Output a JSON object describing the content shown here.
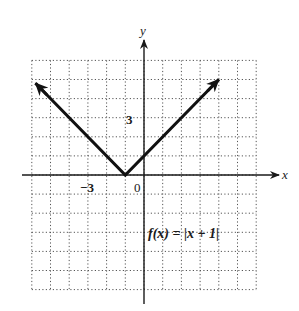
{
  "chart_data": {
    "type": "line",
    "title": "",
    "function_label": "f(x) = |x + 1|",
    "xlabel": "x",
    "ylabel": "y",
    "xlim": [
      -6,
      6
    ],
    "ylim": [
      -6,
      6
    ],
    "grid": true,
    "grid_style": "dotted",
    "tick_labels": {
      "x": [
        {
          "value": -3,
          "label": "−3"
        }
      ],
      "y": [
        {
          "value": 3,
          "label": "3"
        }
      ],
      "origin": "0"
    },
    "series": [
      {
        "name": "f(x) = |x + 1|",
        "x": [
          -5.8,
          -1,
          4
        ],
        "y": [
          4.8,
          0,
          5
        ],
        "arrows_at_ends": true,
        "color": "#1a1a1a"
      }
    ],
    "vertex": {
      "x": -1,
      "y": 0
    }
  },
  "labels": {
    "x_axis": "x",
    "y_axis": "y",
    "tick_neg3": "−3",
    "tick_3": "3",
    "origin": "0",
    "f_name": "f",
    "f_arg": "(x)",
    "f_eq": " = ",
    "f_body": "|x + 1|"
  },
  "colors": {
    "axis": "#1a1a1a",
    "grid": "#555555",
    "curve": "#111111",
    "background": "#ffffff"
  }
}
